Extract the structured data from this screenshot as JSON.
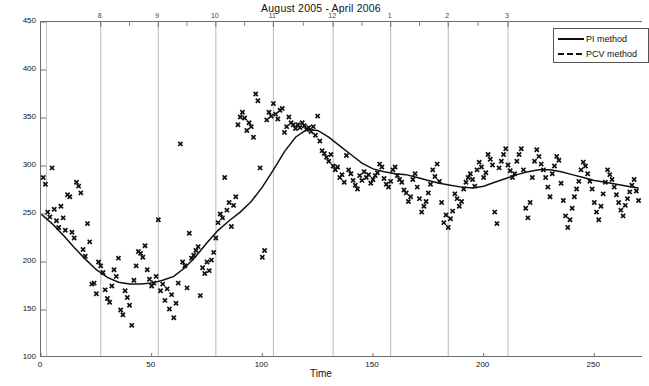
{
  "chart_data": {
    "type": "scatter",
    "title": "August 2005 - April 2006",
    "xlabel": "Time",
    "ylabel": "Dobson Units",
    "xlim": [
      0,
      272
    ],
    "ylim": [
      100,
      450
    ],
    "xticks": [
      0,
      50,
      100,
      150,
      200,
      250
    ],
    "yticks": [
      100,
      150,
      200,
      250,
      300,
      350,
      400,
      450
    ],
    "grid": "vertical-only",
    "top_axis": {
      "label": "month",
      "ticks": [
        8,
        9,
        10,
        11,
        12,
        1,
        2,
        3
      ],
      "tick_positions": [
        27,
        53,
        79,
        105,
        132,
        158,
        184,
        211
      ]
    },
    "legend": {
      "position": "top-right",
      "entries": [
        {
          "name": "PI method",
          "style": "solid"
        },
        {
          "name": "PCV method",
          "style": "dashed"
        }
      ]
    },
    "series": [
      {
        "name": "PI method",
        "style": "solid",
        "type": "line",
        "x": [
          0,
          5,
          10,
          15,
          20,
          25,
          30,
          35,
          40,
          45,
          50,
          55,
          60,
          65,
          70,
          75,
          80,
          85,
          90,
          95,
          100,
          105,
          110,
          115,
          120,
          125,
          130,
          135,
          140,
          145,
          150,
          155,
          160,
          165,
          170,
          175,
          180,
          185,
          190,
          195,
          200,
          205,
          210,
          215,
          220,
          225,
          230,
          235,
          240,
          245,
          250,
          255,
          260,
          265,
          270
        ],
        "y": [
          250,
          240,
          228,
          215,
          203,
          192,
          184,
          179,
          177,
          177,
          178,
          181,
          185,
          194,
          206,
          220,
          233,
          243,
          252,
          263,
          278,
          296,
          315,
          330,
          338,
          337,
          330,
          321,
          312,
          303,
          297,
          294,
          292,
          291,
          288,
          285,
          282,
          280,
          278,
          277,
          279,
          283,
          287,
          291,
          294,
          296,
          296,
          294,
          291,
          288,
          285,
          283,
          281,
          279,
          277
        ]
      },
      {
        "name": "PCV method",
        "style": "dashed",
        "type": "line",
        "note": "legend entry only; curve coincides with PI method"
      },
      {
        "name": "observations",
        "style": "scatter-marker-x",
        "points": [
          [
            1,
            288
          ],
          [
            2,
            281
          ],
          [
            3,
            252
          ],
          [
            4,
            247
          ],
          [
            5,
            298
          ],
          [
            6,
            255
          ],
          [
            7,
            243
          ],
          [
            8,
            236
          ],
          [
            9,
            258
          ],
          [
            10,
            246
          ],
          [
            11,
            233
          ],
          [
            12,
            270
          ],
          [
            13,
            268
          ],
          [
            14,
            231
          ],
          [
            15,
            225
          ],
          [
            16,
            283
          ],
          [
            17,
            279
          ],
          [
            18,
            272
          ],
          [
            19,
            213
          ],
          [
            20,
            206
          ],
          [
            21,
            240
          ],
          [
            22,
            221
          ],
          [
            23,
            177
          ],
          [
            24,
            178
          ],
          [
            25,
            167
          ],
          [
            26,
            200
          ],
          [
            27,
            196
          ],
          [
            28,
            189
          ],
          [
            29,
            171
          ],
          [
            30,
            162
          ],
          [
            31,
            158
          ],
          [
            32,
            175
          ],
          [
            33,
            192
          ],
          [
            34,
            185
          ],
          [
            35,
            204
          ],
          [
            36,
            150
          ],
          [
            37,
            145
          ],
          [
            38,
            170
          ],
          [
            39,
            163
          ],
          [
            40,
            155
          ],
          [
            41,
            134
          ],
          [
            42,
            181
          ],
          [
            43,
            196
          ],
          [
            44,
            211
          ],
          [
            45,
            209
          ],
          [
            46,
            205
          ],
          [
            47,
            217
          ],
          [
            48,
            192
          ],
          [
            49,
            182
          ],
          [
            50,
            175
          ],
          [
            51,
            178
          ],
          [
            52,
            185
          ],
          [
            53,
            244
          ],
          [
            54,
            170
          ],
          [
            55,
            177
          ],
          [
            56,
            160
          ],
          [
            57,
            172
          ],
          [
            58,
            151
          ],
          [
            59,
            166
          ],
          [
            60,
            142
          ],
          [
            61,
            157
          ],
          [
            62,
            178
          ],
          [
            63,
            323
          ],
          [
            64,
            200
          ],
          [
            65,
            196
          ],
          [
            66,
            173
          ],
          [
            67,
            230
          ],
          [
            68,
            204
          ],
          [
            69,
            207
          ],
          [
            70,
            212
          ],
          [
            71,
            216
          ],
          [
            72,
            165
          ],
          [
            73,
            194
          ],
          [
            74,
            188
          ],
          [
            75,
            200
          ],
          [
            76,
            191
          ],
          [
            77,
            202
          ],
          [
            78,
            210
          ],
          [
            79,
            225
          ],
          [
            80,
            241
          ],
          [
            81,
            250
          ],
          [
            82,
            246
          ],
          [
            83,
            288
          ],
          [
            84,
            254
          ],
          [
            85,
            262
          ],
          [
            86,
            237
          ],
          [
            87,
            259
          ],
          [
            88,
            268
          ],
          [
            89,
            343
          ],
          [
            90,
            351
          ],
          [
            91,
            356
          ],
          [
            92,
            350
          ],
          [
            93,
            337
          ],
          [
            94,
            345
          ],
          [
            95,
            341
          ],
          [
            96,
            330
          ],
          [
            97,
            375
          ],
          [
            98,
            368
          ],
          [
            99,
            298
          ],
          [
            100,
            205
          ],
          [
            101,
            212
          ],
          [
            102,
            348
          ],
          [
            103,
            356
          ],
          [
            104,
            352
          ],
          [
            105,
            365
          ],
          [
            106,
            354
          ],
          [
            107,
            349
          ],
          [
            108,
            358
          ],
          [
            109,
            360
          ],
          [
            110,
            335
          ],
          [
            111,
            341
          ],
          [
            112,
            351
          ],
          [
            113,
            345
          ],
          [
            114,
            343
          ],
          [
            115,
            339
          ],
          [
            116,
            343
          ],
          [
            117,
            340
          ],
          [
            118,
            345
          ],
          [
            119,
            342
          ],
          [
            120,
            338
          ],
          [
            121,
            340
          ],
          [
            122,
            336
          ],
          [
            123,
            341
          ],
          [
            124,
            332
          ],
          [
            125,
            352
          ],
          [
            126,
            326
          ],
          [
            127,
            316
          ],
          [
            128,
            313
          ],
          [
            129,
            309
          ],
          [
            130,
            305
          ],
          [
            131,
            312
          ],
          [
            132,
            300
          ],
          [
            133,
            296
          ],
          [
            134,
            299
          ],
          [
            135,
            288
          ],
          [
            136,
            291
          ],
          [
            137,
            283
          ],
          [
            138,
            311
          ],
          [
            139,
            296
          ],
          [
            140,
            292
          ],
          [
            141,
            285
          ],
          [
            142,
            280
          ],
          [
            143,
            276
          ],
          [
            144,
            290
          ],
          [
            145,
            285
          ],
          [
            146,
            294
          ],
          [
            147,
            288
          ],
          [
            148,
            291
          ],
          [
            149,
            282
          ],
          [
            150,
            286
          ],
          [
            151,
            290
          ],
          [
            152,
            293
          ],
          [
            153,
            302
          ],
          [
            154,
            299
          ],
          [
            155,
            287
          ],
          [
            156,
            281
          ],
          [
            157,
            278
          ],
          [
            158,
            284
          ],
          [
            159,
            296
          ],
          [
            160,
            299
          ],
          [
            161,
            290
          ],
          [
            162,
            286
          ],
          [
            163,
            283
          ],
          [
            164,
            275
          ],
          [
            165,
            272
          ],
          [
            166,
            263
          ],
          [
            167,
            268
          ],
          [
            168,
            286
          ],
          [
            169,
            292
          ],
          [
            170,
            278
          ],
          [
            171,
            266
          ],
          [
            172,
            252
          ],
          [
            173,
            258
          ],
          [
            174,
            263
          ],
          [
            175,
            272
          ],
          [
            176,
            281
          ],
          [
            177,
            296
          ],
          [
            178,
            289
          ],
          [
            179,
            302
          ],
          [
            180,
            284
          ],
          [
            181,
            262
          ],
          [
            182,
            241
          ],
          [
            183,
            249
          ],
          [
            184,
            236
          ],
          [
            185,
            245
          ],
          [
            186,
            253
          ],
          [
            187,
            271
          ],
          [
            188,
            266
          ],
          [
            189,
            258
          ],
          [
            190,
            263
          ],
          [
            191,
            276
          ],
          [
            192,
            283
          ],
          [
            193,
            288
          ],
          [
            194,
            292
          ],
          [
            195,
            286
          ],
          [
            196,
            279
          ],
          [
            197,
            296
          ],
          [
            198,
            304
          ],
          [
            199,
            299
          ],
          [
            200,
            288
          ],
          [
            201,
            293
          ],
          [
            202,
            312
          ],
          [
            203,
            307
          ],
          [
            204,
            301
          ],
          [
            205,
            252
          ],
          [
            206,
            240
          ],
          [
            207,
            298
          ],
          [
            208,
            305
          ],
          [
            209,
            312
          ],
          [
            210,
            318
          ],
          [
            211,
            301
          ],
          [
            212,
            295
          ],
          [
            213,
            288
          ],
          [
            214,
            292
          ],
          [
            215,
            305
          ],
          [
            216,
            312
          ],
          [
            217,
            318
          ],
          [
            218,
            296
          ],
          [
            219,
            256
          ],
          [
            220,
            246
          ],
          [
            221,
            262
          ],
          [
            222,
            288
          ],
          [
            223,
            305
          ],
          [
            224,
            317
          ],
          [
            225,
            310
          ],
          [
            226,
            302
          ],
          [
            227,
            296
          ],
          [
            228,
            288
          ],
          [
            229,
            278
          ],
          [
            230,
            268
          ],
          [
            231,
            292
          ],
          [
            232,
            300
          ],
          [
            233,
            310
          ],
          [
            234,
            306
          ],
          [
            235,
            282
          ],
          [
            236,
            264
          ],
          [
            237,
            248
          ],
          [
            238,
            236
          ],
          [
            239,
            244
          ],
          [
            240,
            256
          ],
          [
            241,
            268
          ],
          [
            242,
            276
          ],
          [
            243,
            284
          ],
          [
            244,
            296
          ],
          [
            245,
            304
          ],
          [
            246,
            300
          ],
          [
            247,
            292
          ],
          [
            248,
            284
          ],
          [
            249,
            276
          ],
          [
            250,
            262
          ],
          [
            251,
            252
          ],
          [
            252,
            244
          ],
          [
            253,
            258
          ],
          [
            254,
            271
          ],
          [
            255,
            283
          ],
          [
            256,
            296
          ],
          [
            257,
            291
          ],
          [
            258,
            286
          ],
          [
            259,
            278
          ],
          [
            260,
            270
          ],
          [
            261,
            262
          ],
          [
            262,
            254
          ],
          [
            263,
            248
          ],
          [
            264,
            259
          ],
          [
            265,
            266
          ],
          [
            266,
            273
          ],
          [
            267,
            280
          ],
          [
            268,
            286
          ],
          [
            269,
            274
          ],
          [
            270,
            264
          ]
        ]
      }
    ]
  }
}
